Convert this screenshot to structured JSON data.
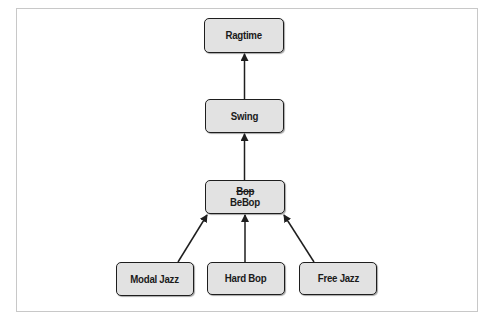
{
  "diagram": {
    "type": "hierarchy",
    "colors": {
      "node_fill": "#e2e2e2",
      "node_border": "#1e1e1e",
      "arrow": "#1e1e1e",
      "frame_border": "#c8c8c8"
    },
    "nodes": {
      "ragtime": {
        "label": "Ragtime"
      },
      "swing": {
        "label": "Swing"
      },
      "bebop": {
        "label_old": "Bop",
        "label": "BeBop"
      },
      "modal_jazz": {
        "label": "Modal Jazz"
      },
      "hard_bop": {
        "label": "Hard Bop"
      },
      "free_jazz": {
        "label": "Free Jazz"
      }
    },
    "edges": [
      {
        "from": "Swing",
        "to": "Ragtime"
      },
      {
        "from": "BeBop",
        "to": "Swing"
      },
      {
        "from": "Modal Jazz",
        "to": "BeBop"
      },
      {
        "from": "Hard Bop",
        "to": "BeBop"
      },
      {
        "from": "Free Jazz",
        "to": "BeBop"
      }
    ]
  }
}
